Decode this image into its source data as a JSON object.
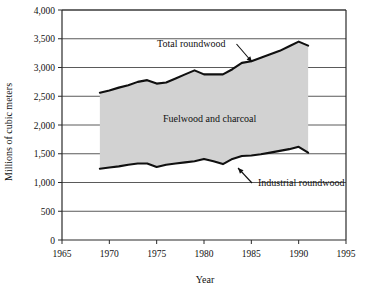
{
  "chart_data": {
    "type": "area",
    "title": "",
    "xlabel": "Year",
    "ylabel": "Millions of cubic meters",
    "xlim": [
      1965,
      1995
    ],
    "ylim": [
      0,
      4000
    ],
    "grid": true,
    "legend_position": "inline-annotations",
    "x_ticks": [
      "1965",
      "1970",
      "1975",
      "1980",
      "1985",
      "1990",
      "1995"
    ],
    "x_tick_values": [
      1965,
      1970,
      1975,
      1980,
      1985,
      1990,
      1995
    ],
    "y_ticks": [
      "0",
      "500",
      "1,000",
      "1,500",
      "2,000",
      "2,500",
      "3,000",
      "3,500",
      "4,000"
    ],
    "y_tick_values": [
      0,
      500,
      1000,
      1500,
      2000,
      2500,
      3000,
      3500,
      4000
    ],
    "x": [
      1969,
      1970,
      1971,
      1972,
      1973,
      1974,
      1975,
      1976,
      1977,
      1978,
      1979,
      1980,
      1981,
      1982,
      1983,
      1984,
      1985,
      1986,
      1987,
      1988,
      1989,
      1990,
      1991
    ],
    "series": [
      {
        "name": "Total roundwood",
        "values": [
          2560,
          2600,
          2650,
          2690,
          2750,
          2780,
          2720,
          2740,
          2810,
          2880,
          2950,
          2880,
          2880,
          2880,
          2970,
          3080,
          3110,
          3170,
          3230,
          3290,
          3370,
          3450,
          3380
        ]
      },
      {
        "name": "Industrial roundwood",
        "values": [
          1240,
          1260,
          1280,
          1310,
          1330,
          1330,
          1270,
          1310,
          1330,
          1350,
          1370,
          1410,
          1370,
          1320,
          1410,
          1460,
          1470,
          1490,
          1520,
          1550,
          1580,
          1620,
          1520
        ]
      }
    ],
    "band": {
      "name": "Fuelwood and charcoal",
      "upper_series": "Total roundwood",
      "lower_series": "Industrial roundwood",
      "fill_color": "#d2d2d2"
    },
    "annotations": [
      {
        "text": "Total roundwood",
        "x_px": 157,
        "y_px": 47,
        "leader_to_x_px": 252,
        "leader_to_y_px": 62
      },
      {
        "text": "Fuelwood and charcoal",
        "x_px": 163,
        "y_px": 122,
        "leader": false
      },
      {
        "text": "Industrial roundwood",
        "x_px": 258,
        "y_px": 186,
        "leader_to_x_px": 238,
        "leader_to_y_px": 168
      }
    ],
    "colors": {
      "line": "#101010",
      "band_fill": "#d2d2d2",
      "grid": "#5a5a5a",
      "frame": "#2a2a2a",
      "background": "#ffffff"
    }
  }
}
